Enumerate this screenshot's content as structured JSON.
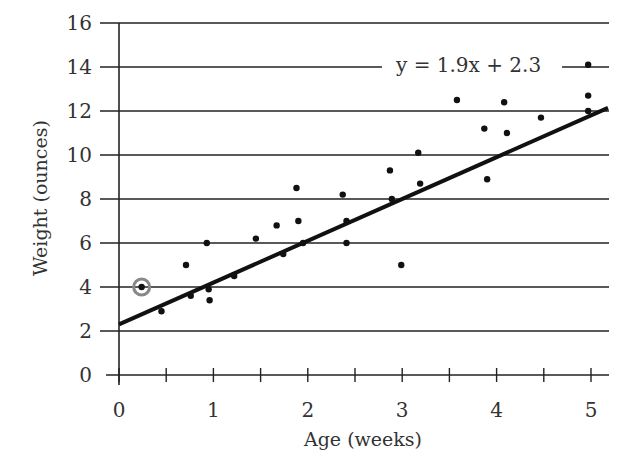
{
  "chart_data": {
    "type": "scatter",
    "title": "",
    "xlabel": "Age (weeks)",
    "ylabel": "Weight (ounces)",
    "xlim": [
      0,
      5.2
    ],
    "ylim": [
      0,
      16
    ],
    "x_ticks": [
      0,
      1,
      2,
      3,
      4,
      5
    ],
    "x_minor_ticks": [
      0.5,
      1.5,
      2.5,
      3.5,
      4.5
    ],
    "y_ticks": [
      0,
      2,
      4,
      6,
      8,
      10,
      12,
      14,
      16
    ],
    "grid": "horizontal",
    "legend": null,
    "trendline": {
      "label": "y = 1.9x + 2.3",
      "slope": 1.9,
      "intercept": 2.3,
      "x_range": [
        0,
        5.2
      ]
    },
    "highlighted_point": {
      "x": 0.24,
      "y": 4.0,
      "note": "circled"
    },
    "series": [
      {
        "name": "observations",
        "points": [
          {
            "x": 0.24,
            "y": 4.0
          },
          {
            "x": 0.45,
            "y": 2.9
          },
          {
            "x": 0.71,
            "y": 5.0
          },
          {
            "x": 0.76,
            "y": 3.6
          },
          {
            "x": 0.93,
            "y": 6.0
          },
          {
            "x": 0.95,
            "y": 3.9
          },
          {
            "x": 0.96,
            "y": 3.4
          },
          {
            "x": 1.22,
            "y": 4.5
          },
          {
            "x": 1.45,
            "y": 6.2
          },
          {
            "x": 1.67,
            "y": 6.8
          },
          {
            "x": 1.74,
            "y": 5.5
          },
          {
            "x": 1.88,
            "y": 8.5
          },
          {
            "x": 1.9,
            "y": 7.0
          },
          {
            "x": 1.95,
            "y": 6.0
          },
          {
            "x": 2.37,
            "y": 8.2
          },
          {
            "x": 2.41,
            "y": 7.0
          },
          {
            "x": 2.41,
            "y": 6.0
          },
          {
            "x": 2.87,
            "y": 9.3
          },
          {
            "x": 2.89,
            "y": 8.0
          },
          {
            "x": 2.99,
            "y": 5.0
          },
          {
            "x": 3.17,
            "y": 10.1
          },
          {
            "x": 3.19,
            "y": 8.7
          },
          {
            "x": 3.58,
            "y": 12.5
          },
          {
            "x": 3.87,
            "y": 11.2
          },
          {
            "x": 3.9,
            "y": 8.9
          },
          {
            "x": 4.08,
            "y": 12.4
          },
          {
            "x": 4.11,
            "y": 11.0
          },
          {
            "x": 4.47,
            "y": 11.7
          },
          {
            "x": 4.97,
            "y": 14.1
          },
          {
            "x": 4.97,
            "y": 12.7
          },
          {
            "x": 4.97,
            "y": 12.0
          }
        ]
      }
    ]
  },
  "labels": {
    "equation": "y = 1.9x + 2.3",
    "x_axis_title": "Age (weeks)",
    "y_axis_title": "Weight (ounces)"
  },
  "colors": {
    "ink": "#222222",
    "text": "#333333",
    "highlight_ring": "#888888"
  }
}
